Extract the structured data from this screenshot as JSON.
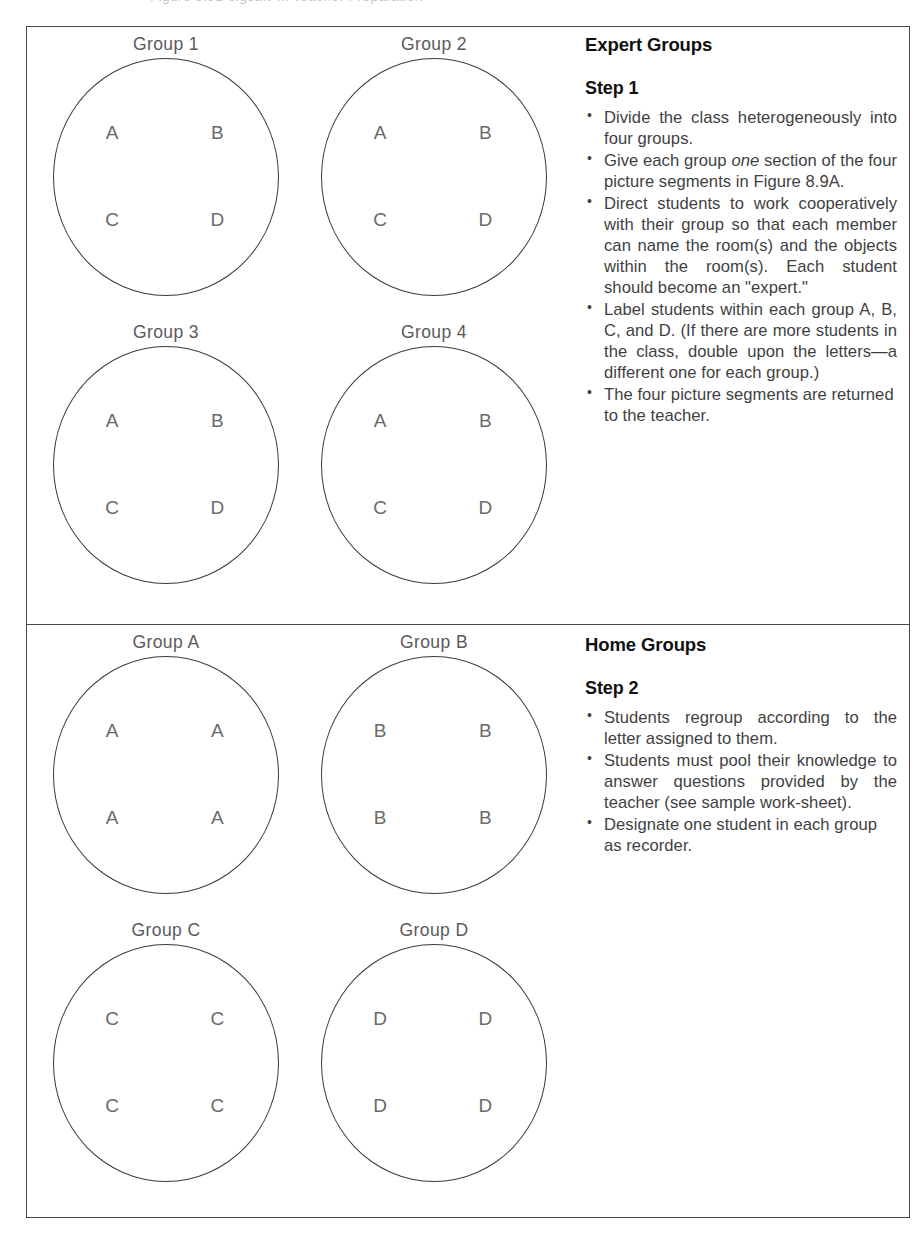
{
  "figure": {
    "top_caption_partial": "Figure 8.9B  Jigsaw II: Teacher Preparation",
    "background_color": "#ffffff",
    "border_color": "#4a4a4a",
    "line_color": "#3c3c3c",
    "label_color": "#5a5a5a"
  },
  "sections": [
    {
      "id": "expert",
      "heading": "Expert Groups",
      "step_heading": "Step 1",
      "groups": [
        {
          "caption": "Group 1",
          "members": [
            "A",
            "B",
            "C",
            "D"
          ]
        },
        {
          "caption": "Group 2",
          "members": [
            "A",
            "B",
            "C",
            "D"
          ]
        },
        {
          "caption": "Group 3",
          "members": [
            "A",
            "B",
            "C",
            "D"
          ]
        },
        {
          "caption": "Group 4",
          "members": [
            "A",
            "B",
            "C",
            "D"
          ]
        }
      ],
      "bullets": [
        "Divide the  class heterogeneously into four groups.",
        "Give each group one section of the four picture segments in Figure 8.9A.",
        "Direct students to work cooperatively with their group so that each member can name the room(s) and the objects within the room(s). Each student should become an \"expert.\"",
        "Label students within each group A, B, C, and D. (If there are more students in the class, double upon the letters—a different one for each group.)",
        "The four picture segments are returned to the teacher."
      ],
      "bullet_emphasis": {
        "2": "one"
      }
    },
    {
      "id": "home",
      "heading": "Home Groups",
      "step_heading": "Step 2",
      "groups": [
        {
          "caption": "Group A",
          "members": [
            "A",
            "A",
            "A",
            "A"
          ]
        },
        {
          "caption": "Group B",
          "members": [
            "B",
            "B",
            "B",
            "B"
          ]
        },
        {
          "caption": "Group C",
          "members": [
            "C",
            "C",
            "C",
            "C"
          ]
        },
        {
          "caption": "Group D",
          "members": [
            "D",
            "D",
            "D",
            "D"
          ]
        }
      ],
      "bullets": [
        "Students regroup according to the letter assigned to them.",
        "Students must pool their knowledge to answer questions provided by the teacher (see sample work-sheet).",
        "Designate one student in each group as recorder."
      ],
      "bullet_emphasis": {}
    }
  ]
}
